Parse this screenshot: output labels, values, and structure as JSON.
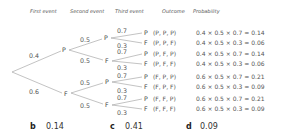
{
  "headers": {
    "first_event": "First event",
    "second_event": "Second event",
    "third_event": "Third event",
    "outcome": "Outcome",
    "probability": "Probability"
  },
  "tree": {
    "first": {
      "P": {
        "label": "P",
        "prob": "0.4"
      },
      "F": {
        "label": "F",
        "prob": "0.6"
      }
    },
    "second": [
      {
        "label": "P",
        "prob": "0.5"
      },
      {
        "label": "F",
        "prob": "0.5"
      },
      {
        "label": "P",
        "prob": "0.5"
      },
      {
        "label": "F",
        "prob": "0.5"
      }
    ],
    "third": [
      {
        "label": "P",
        "prob": "0.7"
      },
      {
        "label": "F",
        "prob": "0.3"
      },
      {
        "label": "P",
        "prob": "0.7"
      },
      {
        "label": "F",
        "prob": "0.3"
      },
      {
        "label": "P",
        "prob": "0.7"
      },
      {
        "label": "F",
        "prob": "0.3"
      },
      {
        "label": "P",
        "prob": "0.7"
      },
      {
        "label": "F",
        "prob": "0.3"
      }
    ]
  },
  "rows": [
    {
      "outcome": "(P, P, P)",
      "probability": "0.4 × 0.5 × 0.7 = 0.14"
    },
    {
      "outcome": "(P, P, F)",
      "probability": "0.4 × 0.5 × 0.3 = 0.06"
    },
    {
      "outcome": "(P, F, P)",
      "probability": "0.4 × 0.5 × 0.7 = 0.14"
    },
    {
      "outcome": "(P, F, F)",
      "probability": "0.4 × 0.5 × 0.3 = 0.06"
    },
    {
      "outcome": "(F, P, P)",
      "probability": "0.6 × 0.5 × 0.7 = 0.21"
    },
    {
      "outcome": "(F, P, F)",
      "probability": "0.6 × 0.5 × 0.3 = 0.09"
    },
    {
      "outcome": "(F, F, P)",
      "probability": "0.6 × 0.5 × 0.7 = 0.21"
    },
    {
      "outcome": "(F, F, F)",
      "probability": "0.6 × 0.5 × 0.3 = 0.09"
    }
  ],
  "answers": [
    {
      "letter": "b",
      "value": "0.14"
    },
    {
      "letter": "c",
      "value": "0.41"
    },
    {
      "letter": "d",
      "value": "0.09"
    }
  ]
}
